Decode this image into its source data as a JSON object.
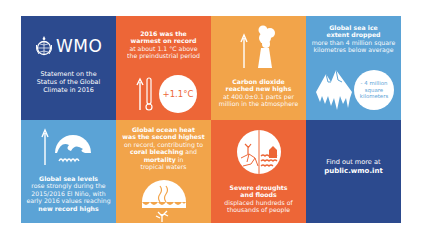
{
  "colors": {
    "navy": "#2c4a8e",
    "red": "#ed6637",
    "orange": "#f2a44a",
    "sky": "#5ba3d6",
    "white": "#ffffff"
  },
  "header": {
    "logo_text": "WMO",
    "subtitle_lines": [
      "Statement on the",
      "Status of the Global",
      "Climate in 2016"
    ]
  },
  "tiles": {
    "temperature": {
      "headline_lines": [
        "2016 was the",
        "warmest on record"
      ],
      "detail_lines": [
        "at about 1.1 °C  above",
        "the preindustrial period"
      ],
      "badge": "+1.1°C",
      "icon": "thermometer-up-icon"
    },
    "co2": {
      "headline_lines": [
        "Carbon dioxide",
        "reached new highs"
      ],
      "detail_lines": [
        "at 400.0±0.1 parts per",
        "million in the atmosphere"
      ],
      "icon": "smokestack-up-icon"
    },
    "sea_ice": {
      "headline_lines": [
        "Global sea ice",
        "extent dropped"
      ],
      "detail_lines": [
        "more than 4 million square",
        "kilometres below average"
      ],
      "badge_lines": [
        "- 4 million",
        "square",
        "kilometers"
      ],
      "icon": "melting-iceberg-icon"
    },
    "sea_level": {
      "headline": "Global sea levels",
      "detail_lines": [
        "rose strongly during the",
        "2015/2016 El Niño, with",
        "early 2016 values reaching"
      ],
      "emphasis": "new record highs",
      "icon": "rising-waves-icon"
    },
    "ocean_heat": {
      "headline_lines": [
        "Global ocean heat",
        "was the second highest"
      ],
      "detail_1": "on record, contributing to",
      "emph_1": "coral bleaching",
      "detail_2": " and",
      "emph_2": "mortality",
      "detail_3": " in",
      "detail_4": "tropical waters",
      "icon": "hot-ocean-coral-icon"
    },
    "droughts": {
      "headline_lines": [
        "Severe droughts",
        "and floods"
      ],
      "detail_lines": [
        "displaced hundreds of",
        "thousands of people"
      ],
      "icon": "drought-flood-icon"
    },
    "more_info": {
      "line1": "Find out more at",
      "url": "public.wmo.int"
    }
  }
}
